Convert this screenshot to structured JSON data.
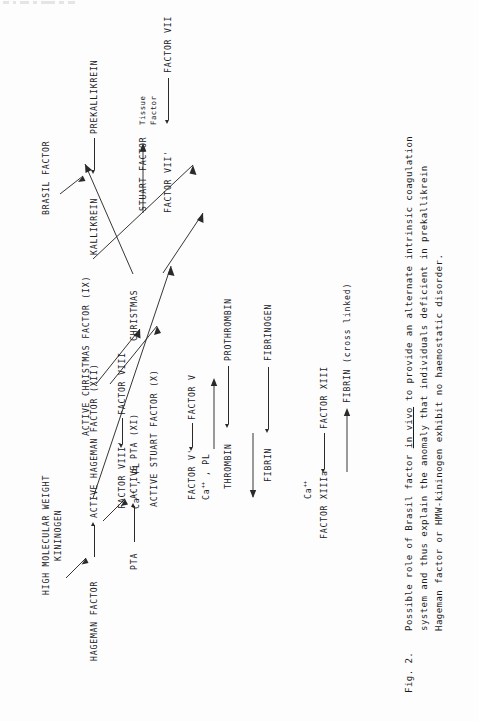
{
  "figure": {
    "number": "Fig. 2.",
    "caption_lines": [
      "Possible role of Brasil factor in vivo to provide an alternate intrinsic coagulation",
      "system and thus explain the anomaly that individuals deficient in prekallikrein",
      "Hageman factor or HMW-kininogen exhibit no haemostatic disorder."
    ],
    "caption_italic_underlined": "in vivo",
    "orientation": "rotated-90-ccw",
    "type": "coagulation-cascade-flow-diagram"
  },
  "diagram": {
    "nodes": {
      "hmw_kininogen_line1": "HIGH MOLECULAR WEIGHT",
      "hmw_kininogen_line2": "KININOGEN",
      "hageman_factor": "HAGEMAN FACTOR",
      "active_hageman_factor": "ACTIVE HAGEMAN FACTOR (XII)",
      "pta": "PTA",
      "active_pta": "ACTIVE PTA (XI)",
      "christmas": "CHRISTMAS",
      "active_christmas_factor": "ACTIVE CHRISTMAS FACTOR (IX)",
      "factor_viii": "FACTOR VIII",
      "factor_viii_prime": "FACTOR VIII'",
      "cofactor_viii_line": "Ca++ , PL",
      "stuart_factor": "STUART FACTOR",
      "active_stuart_factor": "ACTIVE STUART FACTOR (X)",
      "factor_v": "FACTOR V",
      "factor_v_prime": "FACTOR V'",
      "cofactor_v_line": "Ca++ , PL",
      "prothrombin": "PROTHROMBIN",
      "thrombin": "THROMBIN",
      "fibrinogen": "FIBRINOGEN",
      "fibrin": "FIBRIN",
      "factor_xiii": "FACTOR XIII",
      "factor_xiiia": "FACTOR XIIIa",
      "calcium": "Ca++",
      "fibrin_cross_linked": "FIBRIN (cross linked)",
      "prekallikrein": "PREKALLIKREIN",
      "kallikrein": "KALLIKREIN",
      "brasil_factor": "BRASIL FACTOR",
      "factor_vii": "FACTOR VII",
      "factor_vii_prime": "FACTOR VII'",
      "tissue_factor_line1": "Tissue",
      "tissue_factor_line2": "Factor"
    },
    "superscripts": {
      "ca_plus_plus": "++",
      "ca_base": "Ca",
      "ca_rest": " , PL"
    },
    "edges": [
      {
        "from": "HAGEMAN FACTOR",
        "to": "ACTIVE HAGEMAN FACTOR (XII)",
        "catalyst": "HIGH MOLECULAR WEIGHT KININOGEN"
      },
      {
        "from": "PTA",
        "to": "ACTIVE PTA (XI)",
        "catalyst": "ACTIVE HAGEMAN FACTOR (XII)"
      },
      {
        "from": "CHRISTMAS",
        "to": "ACTIVE CHRISTMAS FACTOR (IX)",
        "catalyst": "ACTIVE PTA (XI)"
      },
      {
        "from": "FACTOR VIII",
        "to": "FACTOR VIII'",
        "catalyst": "ACTIVE CHRISTMAS FACTOR (IX)"
      },
      {
        "from": "STUART FACTOR",
        "to": "ACTIVE STUART FACTOR (X)",
        "catalyst": "FACTOR VIII' / Ca++ , PL"
      },
      {
        "from": "FACTOR V",
        "to": "FACTOR V'",
        "catalyst": "ACTIVE STUART FACTOR (X)"
      },
      {
        "from": "PROTHROMBIN",
        "to": "THROMBIN",
        "catalyst": "FACTOR V' / Ca++ , PL"
      },
      {
        "from": "FIBRINOGEN",
        "to": "FIBRIN",
        "catalyst": "THROMBIN"
      },
      {
        "from": "FACTOR XIII",
        "to": "FACTOR XIIIa",
        "catalyst": "Ca++"
      },
      {
        "from": "FIBRIN",
        "to": "FIBRIN (cross linked)",
        "catalyst": "FACTOR XIIIa"
      },
      {
        "from": "PREKALLIKREIN",
        "to": "KALLIKREIN",
        "catalyst": "BRASIL FACTOR"
      },
      {
        "from": "FACTOR VII",
        "to": "FACTOR VII'",
        "catalyst": "Tissue Factor"
      },
      {
        "from": "KALLIKREIN",
        "to": "CHRISTMAS",
        "catalyst": ""
      },
      {
        "from": "KALLIKREIN",
        "to": "FACTOR VII'",
        "catalyst": ""
      },
      {
        "from": "CHRISTMAS",
        "to": "ACTIVE CHRISTMAS FACTOR (IX)",
        "catalyst": ""
      },
      {
        "from": "FACTOR VII'",
        "to": "STUART FACTOR",
        "catalyst": ""
      },
      {
        "from": "STUART FACTOR",
        "to": "ACTIVE STUART FACTOR (X)",
        "catalyst": ""
      }
    ]
  }
}
